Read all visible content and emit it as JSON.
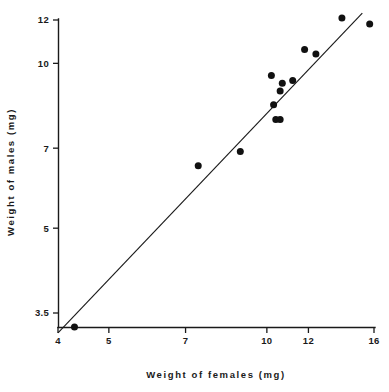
{
  "chart_data": {
    "type": "scatter",
    "title": "",
    "xlabel": "Weight of females (mg)",
    "ylabel": "Weight of males (mg)",
    "xscale": "log",
    "yscale": "log",
    "xlim": [
      4,
      16
    ],
    "ylim": [
      3.2,
      12.4
    ],
    "xticks": [
      4,
      5,
      7,
      10,
      12,
      16
    ],
    "xtick_labels": [
      "4",
      "5",
      "7",
      "10",
      "12",
      "16"
    ],
    "yticks": [
      3.5,
      5,
      7,
      10,
      12
    ],
    "ytick_labels": [
      "3.5",
      "5",
      "7",
      "10",
      "12"
    ],
    "grid": false,
    "legend": false,
    "points": [
      {
        "x": 4.3,
        "y": 3.3
      },
      {
        "x": 7.4,
        "y": 6.5
      },
      {
        "x": 8.9,
        "y": 6.9
      },
      {
        "x": 10.2,
        "y": 9.5
      },
      {
        "x": 10.3,
        "y": 8.4
      },
      {
        "x": 10.4,
        "y": 7.9
      },
      {
        "x": 10.6,
        "y": 7.9
      },
      {
        "x": 10.6,
        "y": 8.9
      },
      {
        "x": 10.7,
        "y": 9.2
      },
      {
        "x": 11.2,
        "y": 9.3
      },
      {
        "x": 11.8,
        "y": 10.6
      },
      {
        "x": 12.4,
        "y": 10.4
      },
      {
        "x": 13.9,
        "y": 12.1
      },
      {
        "x": 15.7,
        "y": 11.8
      }
    ],
    "fit_line": {
      "type": "linear-on-log-axes",
      "x_start": 4.0,
      "y_start": 3.22,
      "x_end": 15.2,
      "y_end": 12.35
    },
    "marker": {
      "shape": "circle",
      "color": "#111111",
      "size_px": 4.6
    }
  },
  "axes": {
    "x_title": "Weight of females (mg)",
    "y_title": "Weight of males (mg)"
  }
}
